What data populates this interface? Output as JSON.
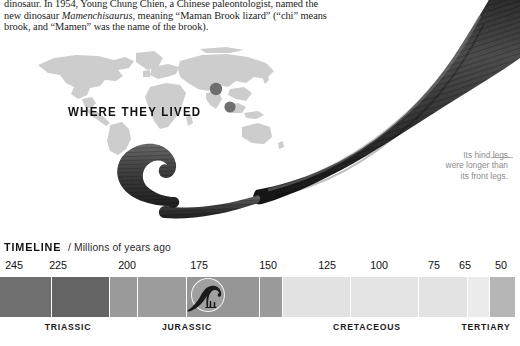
{
  "article": {
    "lines": [
      "dinosaur. In 1954, Young Chung Chien, a Chinese paleontologist, named the",
      "new dinosaur Mamenchisaurus, meaning “Maman Brook lizard” (“chi” means",
      "brook, and “Mamen” was the name of the brook)."
    ],
    "line1_pre": "dinosaur. In 1954, Young Chung Chien, a Chinese paleontologist, named the",
    "line2_pre": "new dinosaur ",
    "line2_italic": "Mamenchisaurus",
    "line2_post": ", meaning “Maman Brook lizard” (“chi” means",
    "line3": "brook, and “Mamen” was the name of the brook)."
  },
  "map": {
    "title": "WHERE THEY LIVED",
    "land_color": "#cdcdcd",
    "dot_color": "#6f6f6f",
    "markers": [
      {
        "label": "northern-china-site",
        "x": 186,
        "y": 42
      },
      {
        "label": "southern-china-site",
        "x": 200,
        "y": 60
      }
    ]
  },
  "callout": {
    "line1": "Its hind legs",
    "line2": "were longer than",
    "line3": "its front legs.",
    "text_color": "#8d8d8d"
  },
  "timeline": {
    "label": "TIMELINE",
    "separator": "/",
    "units": "Millions of years ago",
    "axis_min": 50,
    "axis_max": 245,
    "ticks": [
      {
        "value": "245",
        "x": 14
      },
      {
        "value": "225",
        "x": 58
      },
      {
        "value": "200",
        "x": 127
      },
      {
        "value": "175",
        "x": 199
      },
      {
        "value": "150",
        "x": 268
      },
      {
        "value": "125",
        "x": 327
      },
      {
        "value": "100",
        "x": 379
      },
      {
        "value": "75",
        "x": 434
      },
      {
        "value": "65",
        "x": 465
      },
      {
        "value": "50",
        "x": 501
      }
    ],
    "segments": [
      {
        "name": "seg-1",
        "left": 0,
        "width": 51,
        "color": "#6f6f6f"
      },
      {
        "name": "seg-2",
        "left": 52,
        "width": 57,
        "color": "#646464"
      },
      {
        "name": "seg-3",
        "left": 110,
        "width": 27,
        "color": "#9a9a9a"
      },
      {
        "name": "seg-4",
        "left": 138,
        "width": 48,
        "color": "#9c9c9c"
      },
      {
        "name": "seg-5",
        "left": 187,
        "width": 72,
        "color": "#969696"
      },
      {
        "name": "seg-6",
        "left": 260,
        "width": 22,
        "color": "#9a9a9a"
      },
      {
        "name": "seg-7",
        "left": 283,
        "width": 67,
        "color": "#e2e2e2"
      },
      {
        "name": "seg-8",
        "left": 351,
        "width": 67,
        "color": "#e4e4e4"
      },
      {
        "name": "seg-9",
        "left": 419,
        "width": 48,
        "color": "#e3e3e3"
      },
      {
        "name": "seg-10",
        "left": 468,
        "width": 21,
        "color": "#ebebeb"
      },
      {
        "name": "seg-11",
        "left": 490,
        "width": 25,
        "color": "#b6b6b6"
      }
    ],
    "periods": [
      {
        "name": "TRIASSIC",
        "x": 68
      },
      {
        "name": "JURASSIC",
        "x": 187
      },
      {
        "name": "CRETACEOUS",
        "x": 367
      },
      {
        "name": "TERTIARY",
        "x": 486
      }
    ],
    "marker_icon": "sauropod-icon"
  },
  "icons": {
    "dinosaur_body": "mamenchisaurus-tail-illustration",
    "sauropod_marker": "sauropod-silhouette-icon"
  }
}
